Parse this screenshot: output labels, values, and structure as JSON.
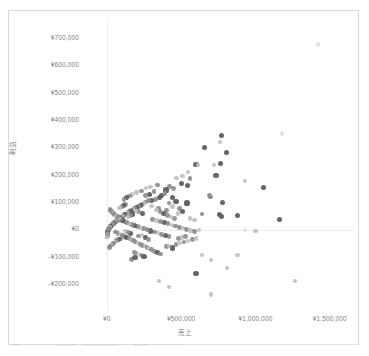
{
  "chart_data": {
    "type": "scatter",
    "title": "",
    "xlabel": "売上",
    "ylabel": "利益",
    "xlim": [
      -120000,
      1650000
    ],
    "ylim": [
      -260000,
      760000
    ],
    "grid": true,
    "legend": "none",
    "x_ticks": [
      "¥0",
      "¥500,000",
      "¥1,000,000",
      "¥1,500,000"
    ],
    "x_tick_values": [
      0,
      500000,
      1000000,
      1500000
    ],
    "y_ticks": [
      "¥700,000",
      "¥600,000",
      "¥500,000",
      "¥400,000",
      "¥300,000",
      "¥200,000",
      "¥100,000",
      "¥0",
      "-¥100,000",
      "-¥200,000"
    ],
    "y_tick_values": [
      700000,
      600000,
      500000,
      400000,
      300000,
      200000,
      100000,
      0,
      -100000,
      -200000
    ],
    "marker_colors": {
      "dark": "#595959",
      "medium": "#8c8c8c",
      "light": "#bfbfbf",
      "faint": "#dedede"
    },
    "points": [
      [
        1420000,
        678000,
        "faint"
      ],
      [
        1180000,
        352000,
        "faint"
      ],
      [
        770000,
        345000,
        "dark"
      ],
      [
        760000,
        322000,
        "light"
      ],
      [
        655000,
        300000,
        "dark"
      ],
      [
        805000,
        283000,
        "dark"
      ],
      [
        600000,
        240000,
        "dark"
      ],
      [
        615000,
        238000,
        "light"
      ],
      [
        765000,
        243000,
        "dark"
      ],
      [
        720000,
        238000,
        "light"
      ],
      [
        545000,
        212000,
        "light"
      ],
      [
        735000,
        200000,
        "dark"
      ],
      [
        930000,
        178000,
        "light"
      ],
      [
        1055000,
        154000,
        "dark"
      ],
      [
        510000,
        196000,
        "light"
      ],
      [
        560000,
        188000,
        "medium"
      ],
      [
        470000,
        190000,
        "light"
      ],
      [
        500000,
        170000,
        "dark"
      ],
      [
        545000,
        162000,
        "dark"
      ],
      [
        420000,
        158000,
        "medium"
      ],
      [
        448000,
        150000,
        "medium"
      ],
      [
        398000,
        146000,
        "dark"
      ],
      [
        690000,
        126000,
        "medium"
      ],
      [
        700000,
        120000,
        "medium"
      ],
      [
        440000,
        118000,
        "dark"
      ],
      [
        355000,
        118000,
        "dark"
      ],
      [
        330000,
        112000,
        "medium"
      ],
      [
        300000,
        108000,
        "dark"
      ],
      [
        281000,
        106000,
        "medium"
      ],
      [
        262000,
        102000,
        "medium"
      ],
      [
        540000,
        98000,
        "dark"
      ],
      [
        778000,
        100000,
        "dark"
      ],
      [
        250000,
        96000,
        "light"
      ],
      [
        237000,
        92000,
        "medium"
      ],
      [
        224000,
        90000,
        "dark"
      ],
      [
        300000,
        88000,
        "light"
      ],
      [
        212000,
        85000,
        "medium"
      ],
      [
        200000,
        82000,
        "dark"
      ],
      [
        188000,
        80000,
        "medium"
      ],
      [
        350000,
        78000,
        "medium"
      ],
      [
        176000,
        76000,
        "light"
      ],
      [
        166000,
        72000,
        "medium"
      ],
      [
        400000,
        70000,
        "medium"
      ],
      [
        156000,
        68000,
        "dark"
      ],
      [
        146000,
        65000,
        "medium"
      ],
      [
        136000,
        62000,
        "light"
      ],
      [
        127000,
        58000,
        "medium"
      ],
      [
        480000,
        60000,
        "light"
      ],
      [
        118000,
        55000,
        "dark"
      ],
      [
        110000,
        52000,
        "medium"
      ],
      [
        102000,
        50000,
        "light"
      ],
      [
        640000,
        58000,
        "medium"
      ],
      [
        94000,
        46000,
        "medium"
      ],
      [
        88000,
        44000,
        "medium"
      ],
      [
        82000,
        40000,
        "dark"
      ],
      [
        760000,
        56000,
        "dark"
      ],
      [
        770000,
        48000,
        "dark"
      ],
      [
        76000,
        38000,
        "light"
      ],
      [
        70000,
        35000,
        "medium"
      ],
      [
        880000,
        52000,
        "dark"
      ],
      [
        65000,
        32000,
        "medium"
      ],
      [
        60000,
        30000,
        "medium"
      ],
      [
        1160000,
        38000,
        "dark"
      ],
      [
        55000,
        28000,
        "light"
      ],
      [
        50000,
        26000,
        "medium"
      ],
      [
        46000,
        24000,
        "dark"
      ],
      [
        42000,
        22000,
        "medium"
      ],
      [
        38000,
        20000,
        "medium"
      ],
      [
        34000,
        18000,
        "light"
      ],
      [
        30000,
        16000,
        "medium"
      ],
      [
        27000,
        14000,
        "medium"
      ],
      [
        24000,
        12000,
        "dark"
      ],
      [
        21000,
        10000,
        "medium"
      ],
      [
        18000,
        8000,
        "light"
      ],
      [
        16000,
        6000,
        "medium"
      ],
      [
        14000,
        4000,
        "medium"
      ],
      [
        12000,
        2000,
        "dark"
      ],
      [
        10000,
        0,
        "medium"
      ],
      [
        9000,
        -2000,
        "medium"
      ],
      [
        8000,
        -4000,
        "light"
      ],
      [
        7000,
        -6000,
        "medium"
      ],
      [
        6000,
        -8000,
        "medium"
      ],
      [
        5000,
        -10000,
        "dark"
      ],
      [
        4500,
        -12000,
        "medium"
      ],
      [
        4000,
        -14000,
        "light"
      ],
      [
        3500,
        -16000,
        "medium"
      ],
      [
        3000,
        -18000,
        "medium"
      ],
      [
        2500,
        -20000,
        "light"
      ],
      [
        2000,
        -22000,
        "medium"
      ],
      [
        1500,
        -24000,
        "medium"
      ],
      [
        1000,
        -26000,
        "light"
      ],
      [
        60000,
        -8000,
        "medium"
      ],
      [
        75000,
        -12000,
        "medium"
      ],
      [
        90000,
        -16000,
        "light"
      ],
      [
        105000,
        -20000,
        "medium"
      ],
      [
        120000,
        -24000,
        "medium"
      ],
      [
        135000,
        -28000,
        "dark"
      ],
      [
        150000,
        -32000,
        "medium"
      ],
      [
        165000,
        -36000,
        "light"
      ],
      [
        180000,
        -40000,
        "medium"
      ],
      [
        195000,
        -44000,
        "medium"
      ],
      [
        210000,
        -48000,
        "light"
      ],
      [
        225000,
        -52000,
        "medium"
      ],
      [
        240000,
        -56000,
        "medium"
      ],
      [
        255000,
        -60000,
        "light"
      ],
      [
        270000,
        -64000,
        "medium"
      ],
      [
        285000,
        -68000,
        "light"
      ],
      [
        300000,
        -72000,
        "medium"
      ],
      [
        320000,
        -78000,
        "medium"
      ],
      [
        340000,
        -84000,
        "dark"
      ],
      [
        360000,
        -88000,
        "medium"
      ],
      [
        230000,
        -92000,
        "medium"
      ],
      [
        250000,
        -96000,
        "dark"
      ],
      [
        205000,
        -86000,
        "light"
      ],
      [
        185000,
        -82000,
        "medium"
      ],
      [
        400000,
        -62000,
        "medium"
      ],
      [
        420000,
        -58000,
        "light"
      ],
      [
        440000,
        -66000,
        "dark"
      ],
      [
        465000,
        -54000,
        "medium"
      ],
      [
        490000,
        -48000,
        "light"
      ],
      [
        520000,
        -44000,
        "medium"
      ],
      [
        545000,
        -40000,
        "light"
      ],
      [
        575000,
        -36000,
        "medium"
      ],
      [
        600000,
        -32000,
        "light"
      ],
      [
        480000,
        -32000,
        "medium"
      ],
      [
        505000,
        -28000,
        "light"
      ],
      [
        530000,
        -24000,
        "medium"
      ],
      [
        418000,
        -24000,
        "medium"
      ],
      [
        395000,
        -20000,
        "dark"
      ],
      [
        370000,
        -16000,
        "medium"
      ],
      [
        345000,
        -12000,
        "light"
      ],
      [
        320000,
        -8000,
        "medium"
      ],
      [
        295000,
        -4000,
        "dark"
      ],
      [
        270000,
        0,
        "medium"
      ],
      [
        248000,
        4000,
        "medium"
      ],
      [
        225000,
        8000,
        "light"
      ],
      [
        205000,
        12000,
        "medium"
      ],
      [
        185000,
        16000,
        "dark"
      ],
      [
        165000,
        20000,
        "medium"
      ],
      [
        148000,
        24000,
        "light"
      ],
      [
        132000,
        28000,
        "medium"
      ],
      [
        118000,
        32000,
        "medium"
      ],
      [
        104000,
        36000,
        "dark"
      ],
      [
        92000,
        40000,
        "medium"
      ],
      [
        80000,
        44000,
        "light"
      ],
      [
        70000,
        48000,
        "medium"
      ],
      [
        60000,
        52000,
        "medium"
      ],
      [
        52000,
        56000,
        "light"
      ],
      [
        45000,
        60000,
        "medium"
      ],
      [
        38000,
        64000,
        "medium"
      ],
      [
        32000,
        68000,
        "light"
      ],
      [
        27000,
        72000,
        "medium"
      ],
      [
        22000,
        76000,
        "medium"
      ],
      [
        310000,
        38000,
        "medium"
      ],
      [
        335000,
        34000,
        "light"
      ],
      [
        362000,
        30000,
        "medium"
      ],
      [
        388000,
        26000,
        "dark"
      ],
      [
        412000,
        22000,
        "medium"
      ],
      [
        438000,
        18000,
        "light"
      ],
      [
        462000,
        14000,
        "medium"
      ],
      [
        488000,
        10000,
        "medium"
      ],
      [
        512000,
        6000,
        "light"
      ],
      [
        538000,
        2000,
        "medium"
      ],
      [
        562000,
        -2000,
        "light"
      ],
      [
        588000,
        -6000,
        "medium"
      ],
      [
        458000,
        42000,
        "medium"
      ],
      [
        432000,
        48000,
        "light"
      ],
      [
        408000,
        54000,
        "medium"
      ],
      [
        382000,
        60000,
        "dark"
      ],
      [
        358000,
        66000,
        "medium"
      ],
      [
        335000,
        72000,
        "light"
      ],
      [
        168000,
        -108000,
        "medium"
      ],
      [
        190000,
        -102000,
        "dark"
      ],
      [
        352000,
        -188000,
        "light"
      ],
      [
        420000,
        -208000,
        "light"
      ],
      [
        600000,
        -158000,
        "dark"
      ],
      [
        700000,
        -236000,
        "light"
      ],
      [
        640000,
        -92000,
        "light"
      ],
      [
        700000,
        -110000,
        "light"
      ],
      [
        810000,
        -140000,
        "light"
      ],
      [
        880000,
        -92000,
        "light"
      ],
      [
        1265000,
        -186000,
        "light"
      ],
      [
        1000000,
        -4000,
        "light"
      ],
      [
        930000,
        0,
        "faint"
      ],
      [
        620000,
        0,
        "light"
      ],
      [
        560000,
        42000,
        "light"
      ],
      [
        590000,
        36000,
        "light"
      ],
      [
        170000,
        130000,
        "light"
      ],
      [
        200000,
        136000,
        "light"
      ],
      [
        232000,
        142000,
        "medium"
      ],
      [
        262000,
        152000,
        "light"
      ],
      [
        150000,
        124000,
        "medium"
      ],
      [
        130000,
        118000,
        "dark"
      ],
      [
        115000,
        112000,
        "medium"
      ],
      [
        240000,
        60000,
        "dark"
      ],
      [
        215000,
        66000,
        "medium"
      ],
      [
        192000,
        70000,
        "light"
      ],
      [
        175000,
        58000,
        "dark"
      ],
      [
        158000,
        52000,
        "medium"
      ],
      [
        142000,
        46000,
        "light"
      ],
      [
        128000,
        92000,
        "medium"
      ],
      [
        112000,
        88000,
        "dark"
      ],
      [
        98000,
        84000,
        "medium"
      ],
      [
        86000,
        80000,
        "light"
      ],
      [
        285000,
        130000,
        "dark"
      ],
      [
        262000,
        126000,
        "medium"
      ],
      [
        318000,
        140000,
        "medium"
      ],
      [
        295000,
        156000,
        "light"
      ],
      [
        342000,
        164000,
        "medium"
      ],
      [
        368000,
        126000,
        "dark"
      ],
      [
        392000,
        132000,
        "medium"
      ],
      [
        465000,
        104000,
        "dark"
      ],
      [
        418000,
        98000,
        "medium"
      ],
      [
        442000,
        86000,
        "light"
      ],
      [
        488000,
        78000,
        "medium"
      ],
      [
        512000,
        68000,
        "dark"
      ],
      [
        258000,
        -28000,
        "dark"
      ],
      [
        278000,
        -34000,
        "medium"
      ],
      [
        212000,
        -22000,
        "medium"
      ],
      [
        238000,
        -18000,
        "light"
      ],
      [
        158000,
        -12000,
        "dark"
      ],
      [
        138000,
        -8000,
        "medium"
      ],
      [
        122000,
        -4000,
        "light"
      ],
      [
        95000,
        -32000,
        "medium"
      ],
      [
        78000,
        -36000,
        "dark"
      ],
      [
        66000,
        -40000,
        "medium"
      ],
      [
        54000,
        -44000,
        "light"
      ],
      [
        44000,
        -48000,
        "medium"
      ],
      [
        36000,
        -52000,
        "medium"
      ],
      [
        28000,
        -56000,
        "light"
      ],
      [
        22000,
        -60000,
        "medium"
      ],
      [
        16000,
        -64000,
        "medium"
      ]
    ]
  }
}
